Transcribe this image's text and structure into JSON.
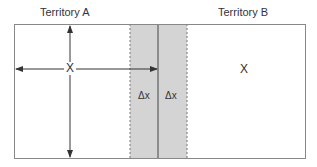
{
  "diagram": {
    "territory_a_label": "Territory A",
    "territory_b_label": "Territory B",
    "territory_a_marker": "X",
    "territory_b_marker": "X",
    "strip_left_label": "Δx",
    "strip_right_label": "Δx"
  },
  "colors": {
    "border": "#888888",
    "strip_fill": "#d0d0d0",
    "arrow": "#333333"
  }
}
